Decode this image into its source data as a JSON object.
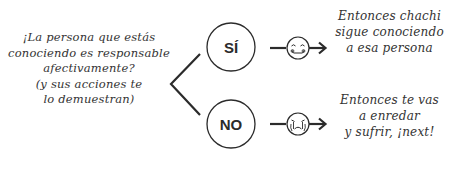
{
  "question": {
    "lines": [
      "¡La persona que estás",
      "conociendo es responsable",
      "afectivamente?",
      "(y sus acciones te",
      "lo demuestran)"
    ]
  },
  "branches": [
    {
      "label": "SÍ",
      "face_icon": "happy-face-icon",
      "outcome_lines": [
        "Entonces chachi",
        "sigue conociendo",
        "a esa persona"
      ]
    },
    {
      "label": "NO",
      "face_icon": "crying-face-icon",
      "outcome_lines": [
        "Entonces te vas",
        "a enredar",
        "y sufrir, ¡next!"
      ]
    }
  ],
  "colors": {
    "stroke": "#2b2b2b",
    "background": "#ffffff"
  }
}
